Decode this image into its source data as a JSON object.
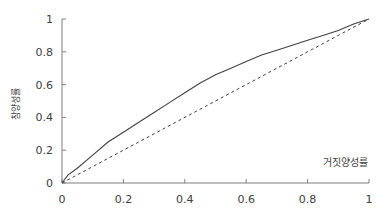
{
  "chart_data": {
    "type": "line",
    "title": "",
    "xlabel": "거짓양성률",
    "ylabel": "참양성률",
    "xlim": [
      0,
      1
    ],
    "ylim": [
      0,
      1
    ],
    "x_ticks": [
      "0",
      "0.2",
      "0.4",
      "0.6",
      "0.8",
      "1"
    ],
    "y_ticks": [
      "0",
      "0.2",
      "0.4",
      "0.6",
      "0.8",
      "1"
    ],
    "grid": false,
    "legend": null,
    "series": [
      {
        "name": "ROC curve",
        "style": "solid",
        "color": "#404040",
        "x": [
          0,
          0.02,
          0.05,
          0.1,
          0.15,
          0.2,
          0.25,
          0.3,
          0.35,
          0.4,
          0.45,
          0.5,
          0.55,
          0.6,
          0.65,
          0.7,
          0.75,
          0.8,
          0.85,
          0.9,
          0.95,
          1
        ],
        "y": [
          0,
          0.05,
          0.09,
          0.17,
          0.25,
          0.31,
          0.37,
          0.43,
          0.49,
          0.55,
          0.61,
          0.66,
          0.7,
          0.74,
          0.78,
          0.81,
          0.84,
          0.87,
          0.9,
          0.93,
          0.97,
          1
        ]
      },
      {
        "name": "Random classifier",
        "style": "dashed",
        "color": "#404040",
        "x": [
          0,
          1
        ],
        "y": [
          0,
          1
        ]
      }
    ]
  }
}
